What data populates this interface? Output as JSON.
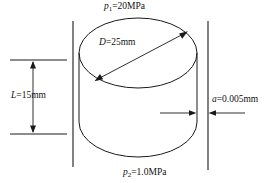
{
  "figure": {
    "name": "cylinder-gap-pressure-diagram",
    "width": 265,
    "height": 183,
    "background_color": "#ffffff",
    "line_color": "#1a1a1a"
  },
  "labels": {
    "top_pressure": {
      "symbol": "p",
      "subscript": "1",
      "equals": "=",
      "value": "20MPa",
      "full_text": "p1=20MPa"
    },
    "bottom_pressure": {
      "symbol": "p",
      "subscript": "2",
      "equals": "=",
      "value": "1.0MPa",
      "full_text": "p2=1.0MPa"
    },
    "diameter": {
      "symbol": "D",
      "equals": "=",
      "value": "25mm",
      "full_text": "D=25mm"
    },
    "length": {
      "symbol": "L",
      "equals": "=",
      "value": "15mm",
      "full_text": "L=15mm"
    },
    "gap": {
      "symbol": "a",
      "equals": "=",
      "value": "0.005mm",
      "full_text": "a=0.005mm"
    }
  },
  "geometry": {
    "cylinder": {
      "top_ellipse_cx": 138,
      "top_ellipse_cy": 53,
      "top_ellipse_rx": 59,
      "top_ellipse_ry": 35,
      "body_left_x": 79,
      "body_right_x": 197,
      "body_top_y": 53,
      "body_bottom_y": 122,
      "bottom_ellipse_ry": 35
    },
    "walls": {
      "left_x": 73,
      "right_x": 208,
      "top_y": 21,
      "bottom_y": 168
    },
    "diameter_arrow": {
      "x1": 96,
      "y1": 80,
      "x2": 186,
      "y2": 32
    },
    "length_dimension": {
      "upper_line_y": 60,
      "lower_line_y": 134,
      "line_x_start": 10,
      "line_x_end": 67,
      "arrow_x": 33
    },
    "gap_arrows": {
      "left_arrow_from_x": 160,
      "left_arrow_to_x": 196,
      "right_arrow_from_x": 245,
      "right_arrow_to_x": 209,
      "y": 113
    }
  }
}
